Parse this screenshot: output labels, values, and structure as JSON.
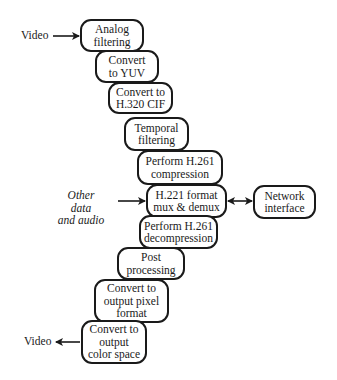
{
  "diagram": {
    "type": "flowchart",
    "inputs": {
      "video_in": "Video",
      "other_data": "Other data\nand audio"
    },
    "outputs": {
      "video_out": "Video"
    },
    "nodes": [
      {
        "id": "analog",
        "label": "Analog\nfiltering"
      },
      {
        "id": "yuv",
        "label": "Convert\nto YUV"
      },
      {
        "id": "cif",
        "label": "Convert to\nH.320 CIF"
      },
      {
        "id": "temporal",
        "label": "Temporal\nfiltering"
      },
      {
        "id": "compress",
        "label": "Perform H.261\ncompression"
      },
      {
        "id": "h221",
        "label": "H.221 format\nmux & demux"
      },
      {
        "id": "network",
        "label": "Network\ninterface"
      },
      {
        "id": "decompress",
        "label": "Perform H.261\ndecompression"
      },
      {
        "id": "post",
        "label": "Post\nprocessing"
      },
      {
        "id": "pixel",
        "label": "Convert to\noutput pixel\nformat"
      },
      {
        "id": "color",
        "label": "Convert to\noutput\ncolor space"
      }
    ],
    "edges": [
      {
        "from": "video_in",
        "to": "analog",
        "type": "arrow"
      },
      {
        "from": "other_data",
        "to": "h221",
        "type": "arrow"
      },
      {
        "from": "h221",
        "to": "network",
        "type": "bidirectional"
      },
      {
        "from": "color",
        "to": "video_out",
        "type": "arrow"
      }
    ]
  }
}
